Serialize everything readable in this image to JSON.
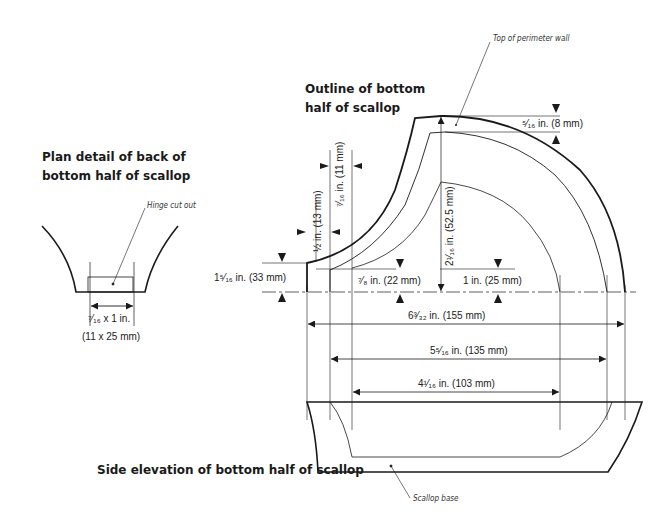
{
  "titles": {
    "plan_detail": "Plan detail of back of bottom half of scallop",
    "plan_detail_line1": "Plan detail of back of",
    "plan_detail_line2": "bottom half of scallop",
    "outline": "Outline of bottom half of scallop",
    "outline_line1": "Outline of bottom",
    "outline_line2": "half of scallop",
    "side_elevation": "Side elevation of bottom half of scallop"
  },
  "callouts": {
    "hinge": "Hinge cut out",
    "perimeter": "Top of perimeter wall",
    "base": "Scallop base"
  },
  "dimensions": {
    "hinge_size_in": "⁷⁄₁₆ x 1 in.",
    "hinge_size_mm": "(11 x 25 mm)",
    "wall_thickness": "⁵⁄₁₆ in. (8 mm)",
    "height_total": "2¹⁄₁₆ in. (52.5 mm)",
    "left_edge_height": "1⁵⁄₁₆ in. (33 mm)",
    "half_inch": "½ in. (13 mm)",
    "seven_sixteenths": "⁷⁄₁₆ in. (11 mm)",
    "seven_eighths": "⁷⁄₈ in. (22 mm)",
    "one_inch": "1 in. (25 mm)",
    "width_outer": "6³⁄₃₂ in. (155 mm)",
    "width_middle": "5⁵⁄₁₆ in. (135 mm)",
    "width_inner": "4¹⁄₁₆ in. (103 mm)"
  },
  "colors": {
    "line": "#1a1a1a",
    "thin_line": "#333333",
    "background": "#ffffff"
  }
}
